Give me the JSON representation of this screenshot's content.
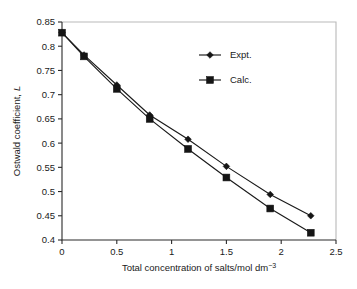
{
  "chart_data": {
    "type": "line",
    "title": "",
    "xlabel": "Total concentration of salts/mol dm⁻³",
    "ylabel": "Ostwald coefficient, L",
    "ylabel_plain": "Ostwald coefficient,",
    "ylabel_italic": "L",
    "xlabel_main": "Total concentration of salts/mol dm",
    "xlabel_sup": "−3",
    "xlim": [
      0,
      2.5
    ],
    "ylim": [
      0.4,
      0.85
    ],
    "grid": false,
    "legend_position": "top-right",
    "x": [
      0,
      0.2,
      0.5,
      0.8,
      1.15,
      1.5,
      1.9,
      2.27
    ],
    "series": [
      {
        "name": "Expt.",
        "marker": "diamond",
        "values": [
          0.828,
          0.782,
          0.72,
          0.658,
          0.608,
          0.552,
          0.494,
          0.45
        ]
      },
      {
        "name": "Calc.",
        "marker": "square",
        "values": [
          0.828,
          0.779,
          0.712,
          0.65,
          0.588,
          0.529,
          0.465,
          0.415
        ]
      }
    ],
    "xticks": [
      0,
      0.5,
      1,
      1.5,
      2,
      2.5
    ],
    "xticklabels": [
      "0",
      "0.5",
      "1",
      "1.5",
      "2",
      "2.5"
    ],
    "yticks": [
      0.4,
      0.45,
      0.5,
      0.55,
      0.6,
      0.65,
      0.7,
      0.75,
      0.8,
      0.85
    ],
    "yticklabels": [
      "0.4",
      "0.45",
      "0.5",
      "0.55",
      "0.6",
      "0.65",
      "0.7",
      "0.75",
      "0.8",
      "0.85"
    ],
    "colors": {
      "line": "#1a1a1a",
      "marker": "#151515",
      "axis": "#2b2b2b",
      "frame_light": "#b9b9b9",
      "background": "#ffffff"
    }
  },
  "legend": {
    "entries": [
      {
        "label": "Expt.",
        "marker": "diamond"
      },
      {
        "label": "Calc.",
        "marker": "square"
      }
    ]
  }
}
